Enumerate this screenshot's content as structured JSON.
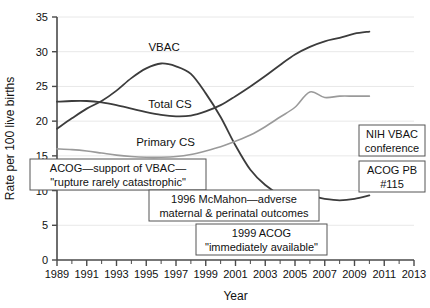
{
  "chart_data": {
    "type": "line",
    "title": "",
    "xlabel": "Year",
    "ylabel": "Rate per 100 live births",
    "xlim": [
      1989,
      2013
    ],
    "ylim": [
      0,
      35
    ],
    "ytick_step": 5,
    "xtick_step": 2,
    "grid": true,
    "legend_position": "inline-labels",
    "ytick_labels": [
      "0",
      "5",
      "10",
      "15",
      "20",
      "25",
      "30",
      "35"
    ],
    "xtick_labels": [
      "1989",
      "1991",
      "1993",
      "1995",
      "1997",
      "1999",
      "2001",
      "2003",
      "2005",
      "2007",
      "2009",
      "2011",
      "2013"
    ],
    "x": [
      1989,
      1990,
      1991,
      1992,
      1993,
      1994,
      1995,
      1996,
      1997,
      1998,
      1999,
      2000,
      2001,
      2002,
      2003,
      2004,
      2005,
      2006,
      2007,
      2008,
      2009,
      2010
    ],
    "series": [
      {
        "name": "VBAC",
        "label": "VBAC",
        "color": "#3c3c3c",
        "width": 1.8,
        "values": [
          18.9,
          20.4,
          21.8,
          22.9,
          24.4,
          26.2,
          27.6,
          28.3,
          27.9,
          26.8,
          24.0,
          20.6,
          16.5,
          13.0,
          10.8,
          9.4,
          8.7,
          9.2,
          8.8,
          8.6,
          8.8,
          9.3
        ]
      },
      {
        "name": "Total CS",
        "label": "Total CS",
        "color": "#3c3c3c",
        "width": 1.8,
        "values": [
          22.8,
          22.9,
          22.9,
          22.7,
          22.3,
          21.8,
          21.3,
          20.9,
          20.7,
          20.8,
          21.4,
          22.3,
          23.6,
          25.0,
          26.5,
          28.1,
          29.6,
          30.7,
          31.5,
          32.0,
          32.6,
          32.9
        ]
      },
      {
        "name": "Primary CS",
        "label": "Primary CS",
        "color": "#9a9a9a",
        "width": 1.6,
        "values": [
          16.0,
          15.9,
          15.7,
          15.4,
          15.1,
          14.9,
          14.8,
          14.8,
          14.9,
          15.2,
          15.7,
          16.3,
          17.1,
          18.0,
          19.2,
          20.6,
          22.0,
          24.2,
          23.4,
          23.6,
          23.6,
          23.6
        ]
      }
    ],
    "series_label_positions": [
      {
        "name": "VBAC",
        "x": 1996.2,
        "y": 30.1
      },
      {
        "name": "Total CS",
        "x": 1996.6,
        "y": 21.9
      },
      {
        "name": "Primary CS",
        "x": 1996.3,
        "y": 16.4
      }
    ],
    "annotations": [
      {
        "id": "acog-support",
        "lines": [
          "ACOG—support of VBAC—",
          "\"rupture rarely catastrophic\""
        ],
        "x": 30,
        "y": 159,
        "width": 176,
        "height": 31
      },
      {
        "id": "mcmahon-1996",
        "lines": [
          "1996 McMahon—adverse",
          "maternal & perinatal outcomes"
        ],
        "x": 149,
        "y": 190,
        "width": 170,
        "height": 31
      },
      {
        "id": "acog-1999",
        "lines": [
          "1999 ACOG",
          "\"immediately available\""
        ],
        "x": 196,
        "y": 224,
        "width": 131,
        "height": 31
      },
      {
        "id": "nih-vbac-conference",
        "lines": [
          "NIH VBAC",
          "conference"
        ],
        "x": 359,
        "y": 125,
        "width": 66,
        "height": 31
      },
      {
        "id": "acog-pb-115",
        "lines": [
          "ACOG PB",
          "#115"
        ],
        "x": 359,
        "y": 161,
        "width": 66,
        "height": 31
      }
    ]
  }
}
